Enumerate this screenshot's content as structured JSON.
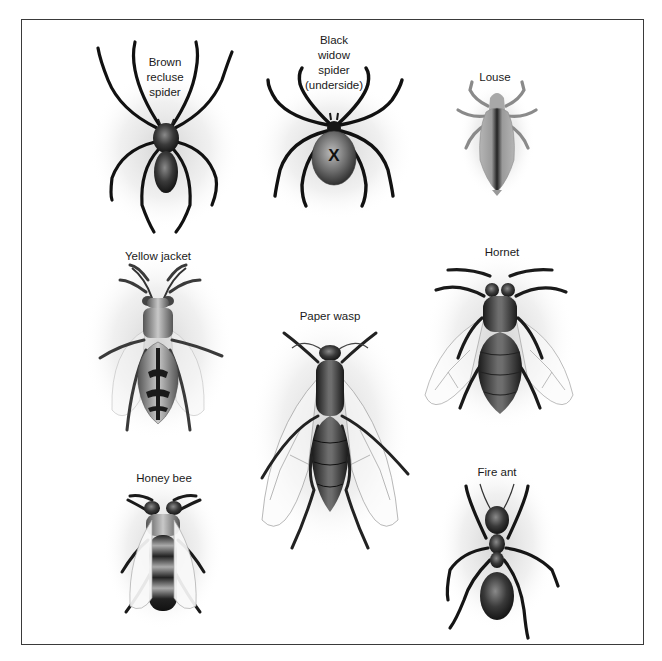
{
  "figure": {
    "specimens": [
      {
        "id": "brown-recluse",
        "label_lines": [
          "Brown",
          "recluse",
          "spider"
        ],
        "label_x": 165,
        "label_y": 55
      },
      {
        "id": "black-widow",
        "label_lines": [
          "Black",
          "widow",
          "spider",
          "(underside)"
        ],
        "label_x": 334,
        "label_y": 33
      },
      {
        "id": "louse",
        "label_lines": [
          "Louse"
        ],
        "label_x": 495,
        "label_y": 70
      },
      {
        "id": "yellow-jacket",
        "label_lines": [
          "Yellow jacket"
        ],
        "label_x": 158,
        "label_y": 249
      },
      {
        "id": "hornet",
        "label_lines": [
          "Hornet"
        ],
        "label_x": 502,
        "label_y": 245
      },
      {
        "id": "paper-wasp",
        "label_lines": [
          "Paper wasp"
        ],
        "label_x": 330,
        "label_y": 309
      },
      {
        "id": "honey-bee",
        "label_lines": [
          "Honey bee"
        ],
        "label_x": 164,
        "label_y": 471
      },
      {
        "id": "fire-ant",
        "label_lines": [
          "Fire ant"
        ],
        "label_x": 497,
        "label_y": 465
      }
    ],
    "black_widow_marking": "X"
  },
  "colors": {
    "frame": "#3a3a3a",
    "ink": "#111111",
    "body_dark": "#2a2a2a",
    "body_mid": "#707070",
    "body_light": "#b8b8b8",
    "wing_vein": "#9a9a9a",
    "halo": "#d8d8d8"
  }
}
